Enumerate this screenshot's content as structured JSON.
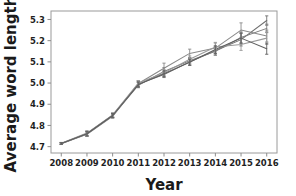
{
  "chart_data": {
    "type": "line",
    "title": "",
    "xlabel": "Year",
    "ylabel": "Average word length",
    "x": [
      2008,
      2009,
      2010,
      2011,
      2012,
      2013,
      2014,
      2015,
      2016
    ],
    "categories": [
      "2008",
      "2009",
      "2010",
      "2011",
      "2012",
      "2013",
      "2014",
      "2015",
      "2016"
    ],
    "xtick_labels": [
      "2008",
      "2009",
      "2010",
      "2011",
      "2012",
      "2013",
      "2014",
      "2015",
      "2016"
    ],
    "ytick_labels": [
      "4.7",
      "4.8",
      "4.9",
      "5.0",
      "5.1",
      "5.2",
      "5.3"
    ],
    "ytick_values": [
      4.7,
      4.8,
      4.9,
      5.0,
      5.1,
      5.2,
      5.3
    ],
    "xlim": [
      2007.6,
      2016.4
    ],
    "ylim": [
      4.67,
      5.34
    ],
    "grid": false,
    "legend": "none",
    "error_bars": true,
    "series": [
      {
        "name": "series-1",
        "color": "#6f6f6f",
        "values": [
          4.715,
          4.762,
          4.848,
          4.995,
          5.04,
          5.1,
          5.152,
          5.205,
          5.295
        ],
        "errors": [
          0.004,
          0.012,
          0.01,
          0.012,
          0.014,
          0.016,
          0.02,
          0.03,
          0.022
        ]
      },
      {
        "name": "series-2",
        "color": "#7d7d7d",
        "values": [
          4.715,
          4.76,
          4.845,
          4.99,
          5.055,
          5.105,
          5.15,
          5.215,
          5.258
        ],
        "errors": [
          0.004,
          0.01,
          0.009,
          0.012,
          0.018,
          0.015,
          0.018,
          0.026,
          0.02
        ]
      },
      {
        "name": "series-3",
        "color": "#8a8a8a",
        "values": [
          4.714,
          4.758,
          4.843,
          4.998,
          5.07,
          5.14,
          5.165,
          5.25,
          5.222
        ],
        "errors": [
          0.004,
          0.01,
          0.009,
          0.014,
          0.024,
          0.02,
          0.024,
          0.034,
          0.028
        ]
      },
      {
        "name": "series-4",
        "color": "#9a9a9a",
        "values": [
          4.716,
          4.764,
          4.85,
          5.0,
          5.048,
          5.112,
          5.17,
          5.182,
          5.212
        ],
        "errors": [
          0.004,
          0.01,
          0.01,
          0.012,
          0.016,
          0.016,
          0.022,
          0.028,
          0.03
        ]
      },
      {
        "name": "series-5",
        "color": "#5e5e5e",
        "values": [
          4.715,
          4.761,
          4.847,
          4.993,
          5.044,
          5.098,
          5.158,
          5.212,
          5.162
        ],
        "errors": [
          0.004,
          0.01,
          0.009,
          0.012,
          0.014,
          0.014,
          0.018,
          0.024,
          0.026
        ]
      }
    ]
  },
  "axes": {
    "xlabel": "Year",
    "ylabel": "Average word length"
  }
}
